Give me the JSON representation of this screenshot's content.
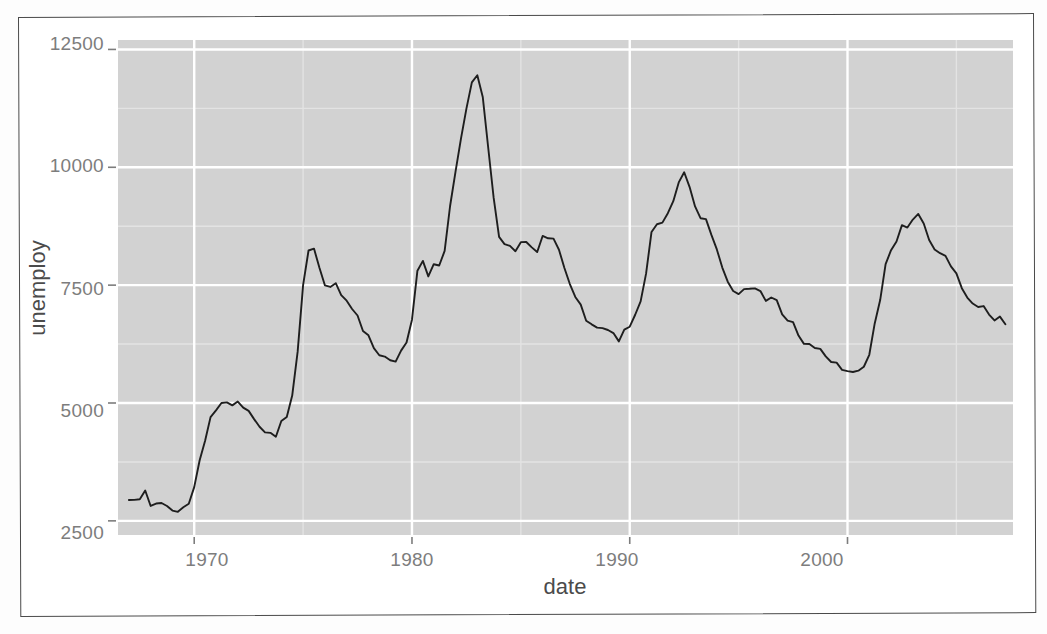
{
  "figure": {
    "kind": "scanned-figure",
    "panel_fill": "#d2d2d2",
    "line_color": "#1e1e1e",
    "major_grid_color": "#ffffff",
    "minor_grid_color": "#e3e3e3",
    "tick_text_color": "#7d7d7d",
    "axis_title_color": "#4b4b4b"
  },
  "axes": {
    "x_title": "date",
    "y_title": "unemploy",
    "x_ticks": [
      "1970",
      "1980",
      "1990",
      "2000"
    ],
    "y_ticks": [
      "2500",
      "5000",
      "7500",
      "10000",
      "12500"
    ]
  },
  "chart_data": {
    "type": "line",
    "title": "",
    "subtitle": "",
    "xlabel": "date",
    "ylabel": "unemploy",
    "xlim": [
      1966.5,
      2007.6
    ],
    "ylim": [
      2200,
      12700
    ],
    "x_ticks": [
      1970,
      1980,
      1990,
      2000
    ],
    "y_ticks": [
      2500,
      5000,
      7500,
      10000,
      12500
    ],
    "x_minor_ticks": [
      1965,
      1975,
      1985,
      1995,
      2005
    ],
    "y_minor_ticks": [
      3750,
      6250,
      8750,
      11250
    ],
    "grid": "major-white-minor-light",
    "legend": "none",
    "series": [
      {
        "name": "unemploy",
        "units": "thousands of persons",
        "x": [
          1967.0,
          1967.25,
          1967.5,
          1967.75,
          1968.0,
          1968.25,
          1968.5,
          1968.75,
          1969.0,
          1969.25,
          1969.5,
          1969.75,
          1970.0,
          1970.25,
          1970.5,
          1970.75,
          1971.0,
          1971.25,
          1971.5,
          1971.75,
          1972.0,
          1972.25,
          1972.5,
          1972.75,
          1973.0,
          1973.25,
          1973.5,
          1973.75,
          1974.0,
          1974.25,
          1974.5,
          1974.75,
          1975.0,
          1975.25,
          1975.5,
          1975.75,
          1976.0,
          1976.25,
          1976.5,
          1976.75,
          1977.0,
          1977.25,
          1977.5,
          1977.75,
          1978.0,
          1978.25,
          1978.5,
          1978.75,
          1979.0,
          1979.25,
          1979.5,
          1979.75,
          1980.0,
          1980.25,
          1980.5,
          1980.75,
          1981.0,
          1981.25,
          1981.5,
          1981.75,
          1982.0,
          1982.25,
          1982.5,
          1982.75,
          1983.0,
          1983.25,
          1983.5,
          1983.75,
          1984.0,
          1984.25,
          1984.5,
          1984.75,
          1985.0,
          1985.25,
          1985.5,
          1985.75,
          1986.0,
          1986.25,
          1986.5,
          1986.75,
          1987.0,
          1987.25,
          1987.5,
          1987.75,
          1988.0,
          1988.25,
          1988.5,
          1988.75,
          1989.0,
          1989.25,
          1989.5,
          1989.75,
          1990.0,
          1990.25,
          1990.5,
          1990.75,
          1991.0,
          1991.25,
          1991.5,
          1991.75,
          1992.0,
          1992.25,
          1992.5,
          1992.75,
          1993.0,
          1993.25,
          1993.5,
          1993.75,
          1994.0,
          1994.25,
          1994.5,
          1994.75,
          1995.0,
          1995.25,
          1995.5,
          1995.75,
          1996.0,
          1996.25,
          1996.5,
          1996.75,
          1997.0,
          1997.25,
          1997.5,
          1997.75,
          1998.0,
          1998.25,
          1998.5,
          1998.75,
          1999.0,
          1999.25,
          1999.5,
          1999.75,
          2000.0,
          2000.25,
          2000.5,
          2000.75,
          2001.0,
          2001.25,
          2001.5,
          2001.75,
          2002.0,
          2002.25,
          2002.5,
          2002.75,
          2003.0,
          2003.25,
          2003.5,
          2003.75,
          2004.0,
          2004.25,
          2004.5,
          2004.75,
          2005.0,
          2005.25,
          2005.5,
          2005.75,
          2006.0,
          2006.25,
          2006.5,
          2006.75,
          2007.0,
          2007.25
        ],
        "y": [
          2944,
          2945,
          2958,
          3143,
          2816,
          2868,
          2878,
          2815,
          2718,
          2692,
          2790,
          2862,
          3215,
          3786,
          4200,
          4701,
          4845,
          5000,
          5014,
          4949,
          5031,
          4903,
          4833,
          4658,
          4496,
          4377,
          4367,
          4285,
          4618,
          4705,
          5158,
          6089,
          7501,
          8235,
          8275,
          7867,
          7496,
          7462,
          7542,
          7289,
          7170,
          6994,
          6856,
          6527,
          6436,
          6164,
          6012,
          5985,
          5906,
          5878,
          6111,
          6283,
          6767,
          7806,
          8014,
          7685,
          7944,
          7916,
          8226,
          9179,
          9908,
          10606,
          11244,
          11801,
          11953,
          11492,
          10420,
          9355,
          8524,
          8369,
          8333,
          8220,
          8412,
          8416,
          8301,
          8202,
          8543,
          8494,
          8486,
          8251,
          7863,
          7524,
          7250,
          7086,
          6746,
          6669,
          6598,
          6588,
          6548,
          6483,
          6307,
          6556,
          6618,
          6872,
          7157,
          7743,
          8628,
          8792,
          8826,
          9026,
          9280,
          9679,
          9894,
          9580,
          9170,
          8920,
          8900,
          8566,
          8258,
          7873,
          7574,
          7375,
          7309,
          7416,
          7422,
          7431,
          7375,
          7166,
          7238,
          7181,
          6881,
          6748,
          6717,
          6431,
          6254,
          6253,
          6167,
          6149,
          5989,
          5869,
          5856,
          5704,
          5677,
          5658,
          5686,
          5769,
          6023,
          6688,
          7183,
          7946,
          8241,
          8426,
          8773,
          8722,
          8891,
          9011,
          8807,
          8456,
          8258,
          8177,
          8122,
          7899,
          7748,
          7436,
          7237,
          7110,
          7037,
          7056,
          6876,
          6751,
          6833,
          6671
        ]
      }
    ]
  }
}
